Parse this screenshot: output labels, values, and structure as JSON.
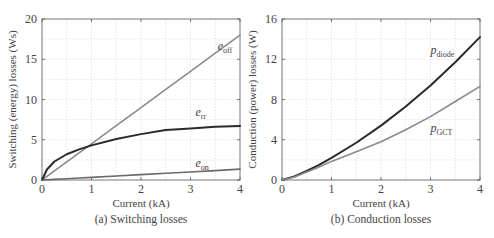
{
  "chart_data": [
    {
      "type": "line",
      "caption": "(a) Switching losses",
      "title": "",
      "xlabel": "Current (kA)",
      "ylabel": "Switching (energy) losses (Ws)",
      "xlim": [
        0,
        4
      ],
      "ylim": [
        0,
        20
      ],
      "xticks": [
        0,
        1,
        2,
        3,
        4
      ],
      "yticks": [
        0,
        5,
        10,
        15,
        20
      ],
      "grid": true,
      "legend": "inline curve labels",
      "x": [
        0,
        0.1,
        0.25,
        0.5,
        0.75,
        1.0,
        1.5,
        2.0,
        2.5,
        3.0,
        3.5,
        4.0
      ],
      "series": [
        {
          "name": "e_off",
          "label_main": "e",
          "label_sub": "off",
          "color": "#8a8a8a",
          "width": 1.6,
          "values": [
            0,
            0.45,
            1.13,
            2.25,
            3.38,
            4.5,
            6.75,
            9.0,
            11.25,
            13.5,
            15.75,
            18.0
          ]
        },
        {
          "name": "e_rr",
          "label_main": "e",
          "label_sub": "rr",
          "color": "#2a2a2a",
          "width": 2.0,
          "values": [
            0,
            1.3,
            2.3,
            3.2,
            3.8,
            4.3,
            5.1,
            5.7,
            6.2,
            6.4,
            6.6,
            6.7
          ]
        },
        {
          "name": "e_on",
          "label_main": "e",
          "label_sub": "on",
          "color": "#6a6a6a",
          "width": 1.6,
          "values": [
            0,
            0.03,
            0.08,
            0.16,
            0.25,
            0.33,
            0.5,
            0.67,
            0.83,
            1.0,
            1.17,
            1.35
          ]
        }
      ],
      "annotations": [
        {
          "text": "e_off",
          "x": 3.55,
          "y": 16.2
        },
        {
          "text": "e_rr",
          "x": 3.1,
          "y": 8.0
        },
        {
          "text": "e_on",
          "x": 3.1,
          "y": 1.6
        }
      ]
    },
    {
      "type": "line",
      "caption": "(b) Conduction losses",
      "title": "",
      "xlabel": "Current (kA)",
      "ylabel": "Conduction (power) losses (W)",
      "xlim": [
        0,
        4
      ],
      "ylim": [
        0,
        16
      ],
      "xticks": [
        0,
        1,
        2,
        3,
        4
      ],
      "yticks": [
        0,
        4,
        8,
        12,
        16
      ],
      "grid": true,
      "legend": "inline curve labels",
      "x": [
        0,
        0.25,
        0.5,
        0.75,
        1.0,
        1.5,
        2.0,
        2.5,
        3.0,
        3.5,
        4.0
      ],
      "series": [
        {
          "name": "p_diode",
          "label_main": "p",
          "label_sub": "diode",
          "color": "#2a2a2a",
          "width": 2.0,
          "values": [
            0,
            0.35,
            0.9,
            1.5,
            2.2,
            3.7,
            5.4,
            7.3,
            9.4,
            11.7,
            14.2
          ]
        },
        {
          "name": "p_GCT",
          "label_main": "p",
          "label_sub": "GCT",
          "color": "#8a8a8a",
          "width": 1.6,
          "values": [
            0,
            0.3,
            0.8,
            1.3,
            1.85,
            2.8,
            3.8,
            5.0,
            6.3,
            7.8,
            9.3
          ]
        }
      ],
      "annotations": [
        {
          "text": "p_diode",
          "x": 3.0,
          "y": 12.5
        },
        {
          "text": "p_GCT",
          "x": 3.0,
          "y": 4.8
        }
      ]
    }
  ]
}
